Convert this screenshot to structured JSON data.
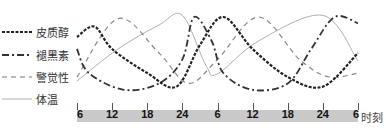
{
  "chart_data": {
    "type": "line",
    "title": "",
    "xlabel": "时刻",
    "ylabel": "",
    "x_ticks": [
      "6",
      "12",
      "18",
      "24",
      "6",
      "12",
      "18",
      "24",
      "6"
    ],
    "x_hours": [
      6,
      12,
      18,
      24,
      30,
      36,
      42,
      48,
      54
    ],
    "grid": false,
    "legend_position": "left",
    "y_units": "relative level (0=low, 1=high)",
    "series": [
      {
        "name": "皮质醇",
        "style": "dotted-thick",
        "color": "#222222",
        "points": [
          [
            6,
            0.7
          ],
          [
            9,
            0.83
          ],
          [
            12,
            0.55
          ],
          [
            18,
            0.25
          ],
          [
            23,
            0.08
          ],
          [
            27,
            0.6
          ],
          [
            31,
            0.95
          ],
          [
            36,
            0.55
          ],
          [
            42,
            0.2
          ],
          [
            48,
            0.08
          ],
          [
            54,
            0.5
          ]
        ]
      },
      {
        "name": "褪黑素",
        "style": "dash-dot",
        "color": "#333333",
        "points": [
          [
            6,
            0.55
          ],
          [
            8,
            0.25
          ],
          [
            14,
            0.04
          ],
          [
            20,
            0.12
          ],
          [
            24,
            0.42
          ],
          [
            26,
            0.95
          ],
          [
            29,
            0.65
          ],
          [
            31,
            0.25
          ],
          [
            36,
            0.04
          ],
          [
            42,
            0.12
          ],
          [
            46,
            0.55
          ],
          [
            50,
            0.95
          ],
          [
            54,
            0.87
          ]
        ]
      },
      {
        "name": "警觉性",
        "style": "dashed",
        "color": "#888888",
        "points": [
          [
            6,
            0.2
          ],
          [
            13,
            0.93
          ],
          [
            20,
            0.5
          ],
          [
            25,
            0.12
          ],
          [
            30,
            0.42
          ],
          [
            37,
            0.95
          ],
          [
            44,
            0.42
          ],
          [
            49,
            0.2
          ],
          [
            54,
            0.25
          ]
        ]
      },
      {
        "name": "体温",
        "style": "solid-thin",
        "color": "#b0b0b0",
        "points": [
          [
            6,
            0.15
          ],
          [
            13,
            0.55
          ],
          [
            20,
            0.85
          ],
          [
            24,
            0.97
          ],
          [
            28,
            0.35
          ],
          [
            30,
            0.24
          ],
          [
            37,
            0.65
          ],
          [
            48,
            0.97
          ],
          [
            54,
            0.4
          ]
        ]
      }
    ]
  },
  "legend": {
    "items": [
      {
        "label": "皮质醇",
        "style": "dotted-thick"
      },
      {
        "label": "褪黑素",
        "style": "dash-dot"
      },
      {
        "label": "警觉性",
        "style": "dashed"
      },
      {
        "label": "体温",
        "style": "solid-thin"
      }
    ]
  },
  "axis": {
    "title": "时刻",
    "ticks": [
      "6",
      "12",
      "18",
      "24",
      "6",
      "12",
      "18",
      "24",
      "6"
    ],
    "bar_color": "#c9c9c9"
  }
}
